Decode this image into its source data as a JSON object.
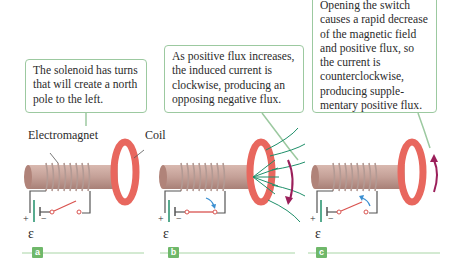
{
  "panels": [
    {
      "id": "a",
      "callout": "The solenoid has turns that will create a north pole to the left.",
      "badge": "a"
    },
    {
      "id": "b",
      "callout": "As positive flux increases, the induced current is clockwise, producing an opposing negative flux.",
      "badge": "b"
    },
    {
      "id": "c",
      "callout": "Opening the switch causes a rapid decrease of the magnetic field and positive flux, so the current is counterclockwise, producing supple-mentary positive flux.",
      "badge": "c"
    }
  ],
  "labels": {
    "electromagnet": "Electromagnet",
    "coil": "Coil",
    "emf": "ε",
    "plus": "+",
    "minus": "−"
  },
  "colors": {
    "callout_border": "#9cc9a0",
    "coil": "#e8675e",
    "core": "#c9a49a",
    "wire": "#555555",
    "switch": "#d9534f",
    "flux": "#1f8f6a",
    "arrow": "#9b1f5a",
    "hint_arrow": "#3b8fd1",
    "badge": "#6fb86a",
    "baseline": "#a8d5a5"
  }
}
